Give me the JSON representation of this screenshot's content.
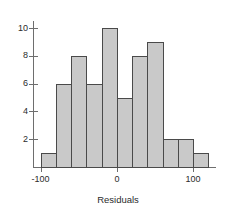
{
  "chart_data": {
    "type": "bar",
    "title": "",
    "subtitle": "",
    "xlabel": "Residuals",
    "ylabel": "",
    "categories": [
      "-100 to -80",
      "-80 to -60",
      "-60 to -40",
      "-40 to -20",
      "-20 to 0",
      "0 to 20",
      "20 to 40",
      "40 to 60",
      "60 to 80",
      "80 to 100",
      "100 to 120"
    ],
    "bin_edges": [
      -100,
      -80,
      -60,
      -40,
      -20,
      0,
      20,
      40,
      60,
      80,
      100,
      120
    ],
    "values": [
      1,
      6,
      8,
      6,
      10,
      5,
      8,
      9,
      2,
      2,
      1
    ],
    "bin_width": 20,
    "xlim": [
      -110,
      130
    ],
    "ylim": [
      0,
      10.5
    ],
    "x_ticks": [
      -100,
      0,
      100
    ],
    "x_tick_labels": [
      "-100",
      "0",
      "100"
    ],
    "y_ticks": [
      2,
      4,
      6,
      8,
      10
    ],
    "y_tick_labels": [
      "2",
      "4",
      "6",
      "8",
      "10"
    ],
    "grid": false,
    "legend": false,
    "legend_position": "none",
    "bar_fill_color": "#c9c9c9",
    "bar_border_color": "#4a4a4a",
    "axis_color": "#6e6e6e",
    "text_color": "#2b2b2b",
    "background_color": "#ffffff"
  }
}
